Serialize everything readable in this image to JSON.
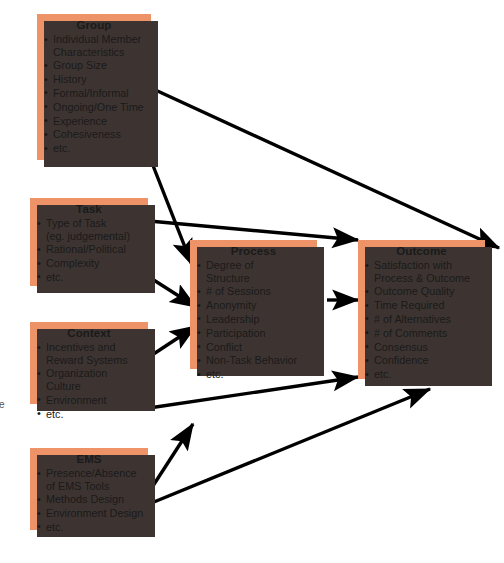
{
  "diagram": {
    "colors": {
      "node_fill": "#ee9367",
      "node_shadow": "#3d3431",
      "arrow": "#000000",
      "background": "#ffffff",
      "text": "#1a1a1a"
    },
    "margin_mark": "e",
    "nodes": [
      {
        "id": "group",
        "title": "Group",
        "items": [
          "Individual Member\nCharacteristics",
          "Group Size",
          "History",
          "Formal/Informal",
          "Ongoing/One Time",
          "Experience",
          "Cohesiveness",
          "etc."
        ]
      },
      {
        "id": "task",
        "title": "Task",
        "items": [
          "Type of Task\n(eg. judgemental)",
          "Rational/Political",
          "Complexity",
          "etc."
        ]
      },
      {
        "id": "context",
        "title": "Context",
        "items": [
          "Incentives and\nReward Systems",
          "Organization Culture",
          "Environment",
          "etc."
        ]
      },
      {
        "id": "ems",
        "title": "EMS",
        "items": [
          "Presence/Absence\nof EMS Tools",
          "Methods Design",
          "Environment Design",
          "etc."
        ]
      },
      {
        "id": "process",
        "title": "Process",
        "items": [
          "Degree of\nStructure",
          "# of Sessions",
          "Anonymity",
          "Leadership",
          "Participation",
          "Conflict",
          "Non-Task Behavior",
          "etc."
        ]
      },
      {
        "id": "outcome",
        "title": "Outcome",
        "items": [
          "Satisfaction with\nProcess & Outcome",
          "Outcome Quality",
          "Time Required",
          "# of Alternatives",
          "# of Comments",
          "Consensus",
          "Confidence",
          "etc."
        ]
      }
    ],
    "edges": [
      {
        "from": "group",
        "to": "outcome",
        "label": ""
      },
      {
        "from": "group",
        "to": "process",
        "label": ""
      },
      {
        "from": "task",
        "to": "outcome",
        "label": ""
      },
      {
        "from": "task",
        "to": "process",
        "label": ""
      },
      {
        "from": "context",
        "to": "process",
        "label": ""
      },
      {
        "from": "context",
        "to": "outcome",
        "label": ""
      },
      {
        "from": "ems",
        "to": "process",
        "label": ""
      },
      {
        "from": "ems",
        "to": "outcome",
        "label": ""
      },
      {
        "from": "process",
        "to": "outcome",
        "label": ""
      }
    ]
  }
}
